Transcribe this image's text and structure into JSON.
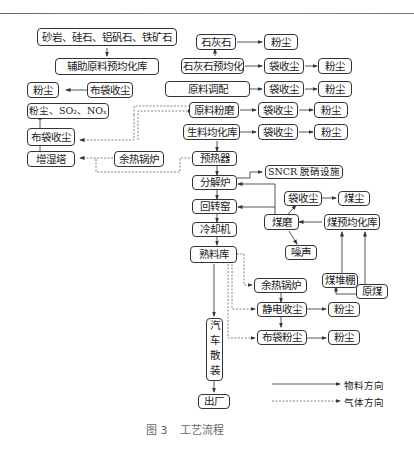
{
  "figure": {
    "caption_number": "图 3",
    "caption_title": "工艺流程"
  },
  "nodes": {
    "raw_stones": "砂岩、硅石、铝矾石、铁矿石",
    "aux_prehomog": "辅助原料预均化库",
    "dust_left_1": "粉尘",
    "bag_collector_left_1": "布袋收尘",
    "dust_sox_nox": "粉尘、SO₂、NOₓ",
    "bag_collector_left_2": "布袋收尘",
    "humidifier_tower": "增湿塔",
    "waste_heat_boiler_top": "余热锅炉",
    "limestone": "石灰石",
    "limestone_dust": "粉尘",
    "limestone_prehomog": "石灰石预均化",
    "bag_1": "袋收尘",
    "dust_1": "粉尘",
    "raw_blending": "原料调配",
    "bag_2": "袋收尘",
    "dust_2": "粉尘",
    "raw_mill": "原料粉磨",
    "bag_3": "袋收尘",
    "dust_3": "粉尘",
    "raw_meal_homog": "生料均化库",
    "bag_4": "袋收尘",
    "dust_4": "粉尘",
    "preheater": "预热器",
    "sncr": "SNCR 脱硝设施",
    "calciner": "分解炉",
    "rotary_kiln": "回转窑",
    "cooler": "冷却机",
    "clinker_store": "熟料库",
    "coal_bag": "袋收尘",
    "coal_dust": "煤尘",
    "coal_mill": "煤磨",
    "coal_prehomog": "煤预均化库",
    "noise": "噪声",
    "coal_shed": "煤堆棚",
    "raw_coal": "原煤",
    "waste_heat_boiler_bottom": "余热锅炉",
    "esp": "静电收尘",
    "esp_dust": "粉尘",
    "bag_dust_collector": "布袋粉尘",
    "bag_dust": "粉尘",
    "truck_bulk": "汽车散装",
    "exit": "出厂"
  },
  "legend": {
    "material_flow": "物料方向",
    "gas_flow": "气体方向"
  },
  "colors": {
    "line": "#444444",
    "dashed": "#777777",
    "caption": "#666666"
  }
}
